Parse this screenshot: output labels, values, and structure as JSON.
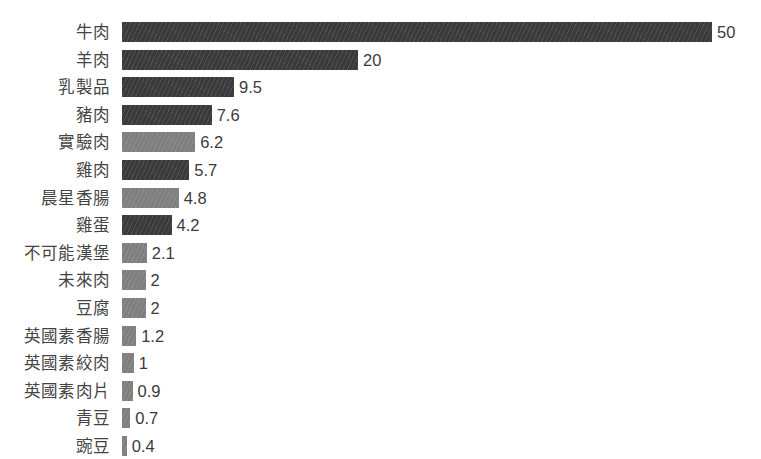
{
  "chart_data": {
    "type": "bar",
    "orientation": "horizontal",
    "title": "",
    "subtitle": "",
    "xlabel": "",
    "ylabel": "",
    "grid": false,
    "legend": null,
    "axis_visible": false,
    "xlim": [
      0,
      50
    ],
    "value_label_format": "plain",
    "categories": [
      "牛肉",
      "羊肉",
      "乳製品",
      "豬肉",
      "實驗肉",
      "雞肉",
      "晨星香腸",
      "雞蛋",
      "不可能漢堡",
      "未來肉",
      "豆腐",
      "英國素香腸",
      "英國素絞肉",
      "英國素肉片",
      "青豆",
      "豌豆"
    ],
    "values": [
      50,
      20,
      9.5,
      7.6,
      6.2,
      5.7,
      4.8,
      4.2,
      2.1,
      2,
      2,
      1.2,
      1,
      0.9,
      0.7,
      0.4
    ],
    "value_labels": [
      "50",
      "20",
      "9.5",
      "7.6",
      "6.2",
      "5.7",
      "4.8",
      "4.2",
      "2.1",
      "2",
      "2",
      "1.2",
      "1",
      "0.9",
      "0.7",
      "0.4"
    ],
    "bar_shades": [
      "dark",
      "dark",
      "dark",
      "dark",
      "light",
      "dark",
      "light",
      "dark",
      "light",
      "light",
      "light",
      "light",
      "light",
      "light",
      "light",
      "light"
    ],
    "colors": {
      "bar_dark": "#3a3a3a",
      "bar_light": "#7f7f7f",
      "label_text": "#444444",
      "value_text": "#3b3b3b",
      "background": "#ffffff"
    }
  }
}
